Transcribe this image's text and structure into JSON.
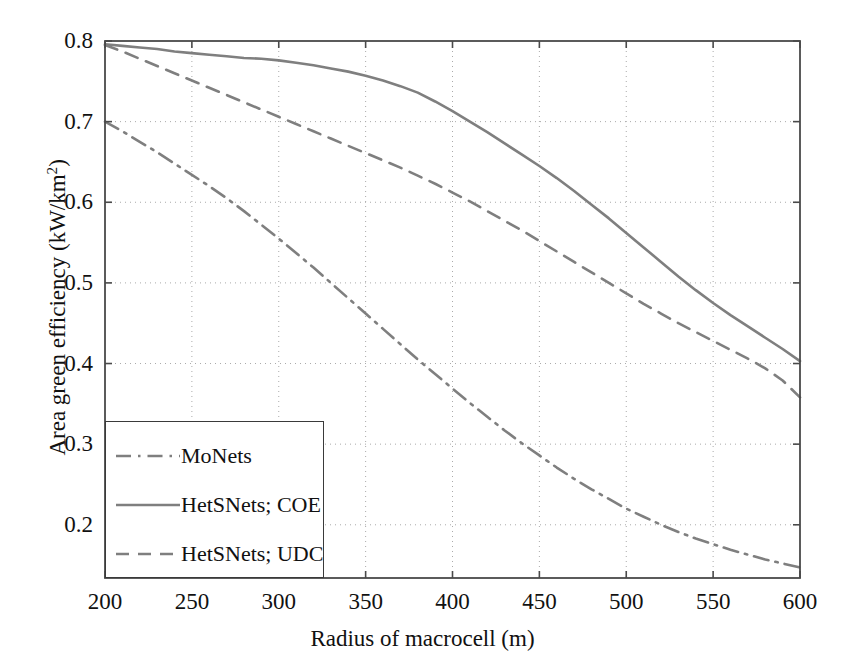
{
  "chart_data": {
    "type": "line",
    "title": "",
    "xlabel": "Radius of macrocell (m)",
    "ylabel": "Area green efficiency (kW/km²)",
    "ylabel_base": "Area green efficiency (kW/km",
    "ylabel_sup": "2",
    "ylabel_tail": ")",
    "xlim": [
      200,
      600
    ],
    "ylim": [
      0.134,
      0.8
    ],
    "xticks": [
      200,
      250,
      300,
      350,
      400,
      450,
      500,
      550,
      600
    ],
    "xtick_labels": [
      "200",
      "250",
      "300",
      "350",
      "400",
      "450",
      "500",
      "550",
      "600"
    ],
    "yticks": [
      0.2,
      0.3,
      0.4,
      0.5,
      0.6,
      0.7,
      0.8
    ],
    "ytick_labels": [
      "0.2",
      "0.3",
      "0.4",
      "0.5",
      "0.6",
      "0.7",
      "0.8"
    ],
    "grid": true,
    "grid_style": "dotted",
    "grid_color": "#aaaaaa",
    "frame_color": "#4a4a4a",
    "line_color": "#7f7f7f",
    "legend_position": "lower left",
    "legend_border": true,
    "x": [
      200,
      210,
      220,
      230,
      240,
      250,
      260,
      270,
      280,
      290,
      300,
      310,
      320,
      330,
      340,
      350,
      360,
      370,
      380,
      390,
      400,
      410,
      420,
      430,
      440,
      450,
      460,
      470,
      480,
      490,
      500,
      510,
      520,
      530,
      540,
      550,
      560,
      570,
      580,
      590,
      600
    ],
    "series": [
      {
        "name": "MoNets",
        "style": "dashdot",
        "color": "#7f7f7f",
        "values": [
          0.7,
          0.688,
          0.675,
          0.662,
          0.648,
          0.634,
          0.62,
          0.605,
          0.589,
          0.572,
          0.555,
          0.537,
          0.519,
          0.5,
          0.481,
          0.462,
          0.443,
          0.424,
          0.405,
          0.387,
          0.369,
          0.351,
          0.334,
          0.317,
          0.301,
          0.286,
          0.271,
          0.257,
          0.244,
          0.232,
          0.22,
          0.21,
          0.2,
          0.191,
          0.183,
          0.176,
          0.169,
          0.163,
          0.157,
          0.152,
          0.147
        ]
      },
      {
        "name": "HetSNets; COE",
        "style": "solid",
        "color": "#7f7f7f",
        "values": [
          0.796,
          0.794,
          0.792,
          0.79,
          0.787,
          0.785,
          0.783,
          0.781,
          0.779,
          0.778,
          0.776,
          0.773,
          0.77,
          0.766,
          0.762,
          0.757,
          0.751,
          0.744,
          0.736,
          0.725,
          0.713,
          0.7,
          0.687,
          0.673,
          0.659,
          0.645,
          0.63,
          0.614,
          0.597,
          0.58,
          0.562,
          0.544,
          0.526,
          0.508,
          0.491,
          0.475,
          0.46,
          0.446,
          0.432,
          0.418,
          0.403
        ]
      },
      {
        "name": "HetSNets; UDC",
        "style": "dashed",
        "color": "#7f7f7f",
        "values": [
          0.795,
          0.787,
          0.778,
          0.769,
          0.76,
          0.751,
          0.742,
          0.733,
          0.724,
          0.715,
          0.706,
          0.697,
          0.688,
          0.679,
          0.67,
          0.661,
          0.652,
          0.643,
          0.633,
          0.623,
          0.612,
          0.601,
          0.589,
          0.577,
          0.565,
          0.552,
          0.539,
          0.526,
          0.513,
          0.5,
          0.487,
          0.474,
          0.462,
          0.45,
          0.439,
          0.428,
          0.417,
          0.406,
          0.394,
          0.379,
          0.358
        ]
      }
    ]
  },
  "legend": {
    "items": [
      {
        "label": "MoNets",
        "style": "dashdot"
      },
      {
        "label": "HetSNets; COE",
        "style": "solid"
      },
      {
        "label": "HetSNets; UDC",
        "style": "dashed"
      }
    ]
  }
}
